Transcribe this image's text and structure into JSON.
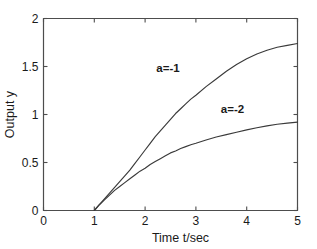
{
  "chart_data": {
    "type": "line",
    "title": "",
    "subtitle": "",
    "xlabel": "Time   t/sec",
    "ylabel": "Output  y",
    "xlim": [
      0,
      5
    ],
    "ylim": [
      0,
      2
    ],
    "xticks": [
      "0",
      "1",
      "2",
      "3",
      "4",
      "5"
    ],
    "xtick_values": [
      0,
      1,
      2,
      3,
      4,
      5
    ],
    "yticks": [
      "0",
      "0.5",
      "1",
      "1.5",
      "2"
    ],
    "ytick_values": [
      0,
      0.5,
      1,
      1.5,
      2
    ],
    "grid": false,
    "legend_position": "inline-annotation",
    "annotations": [
      {
        "text": "a=-1",
        "x": 2.45,
        "y": 1.44
      },
      {
        "text": "a=-2",
        "x": 3.72,
        "y": 1.02
      }
    ],
    "series": [
      {
        "name": "a=-1",
        "label": "a=-1",
        "color": "#3a3a3a",
        "x": [
          1.0,
          1.1,
          1.2,
          1.3,
          1.4,
          1.5,
          1.6,
          1.7,
          1.8,
          1.9,
          2.0,
          2.1,
          2.2,
          2.3,
          2.4,
          2.5,
          2.6,
          2.7,
          2.8,
          2.9,
          3.0,
          3.2,
          3.4,
          3.6,
          3.8,
          4.0,
          4.2,
          4.4,
          4.6,
          4.8,
          5.0
        ],
        "y": [
          0.0,
          0.06,
          0.12,
          0.18,
          0.24,
          0.3,
          0.36,
          0.42,
          0.49,
          0.56,
          0.63,
          0.7,
          0.77,
          0.83,
          0.89,
          0.95,
          1.01,
          1.06,
          1.11,
          1.16,
          1.2,
          1.29,
          1.37,
          1.45,
          1.52,
          1.58,
          1.63,
          1.67,
          1.7,
          1.72,
          1.74
        ]
      },
      {
        "name": "a=-2",
        "label": "a=-2",
        "color": "#3a3a3a",
        "x": [
          1.0,
          1.1,
          1.2,
          1.3,
          1.4,
          1.5,
          1.6,
          1.7,
          1.8,
          1.9,
          2.0,
          2.1,
          2.2,
          2.3,
          2.4,
          2.5,
          2.6,
          2.7,
          2.8,
          2.9,
          3.0,
          3.2,
          3.4,
          3.6,
          3.8,
          4.0,
          4.2,
          4.4,
          4.6,
          4.8,
          5.0
        ],
        "y": [
          0.0,
          0.06,
          0.11,
          0.16,
          0.21,
          0.25,
          0.29,
          0.33,
          0.37,
          0.41,
          0.44,
          0.48,
          0.51,
          0.54,
          0.57,
          0.6,
          0.62,
          0.645,
          0.665,
          0.685,
          0.7,
          0.735,
          0.765,
          0.79,
          0.815,
          0.84,
          0.862,
          0.882,
          0.898,
          0.91,
          0.92
        ]
      }
    ]
  }
}
